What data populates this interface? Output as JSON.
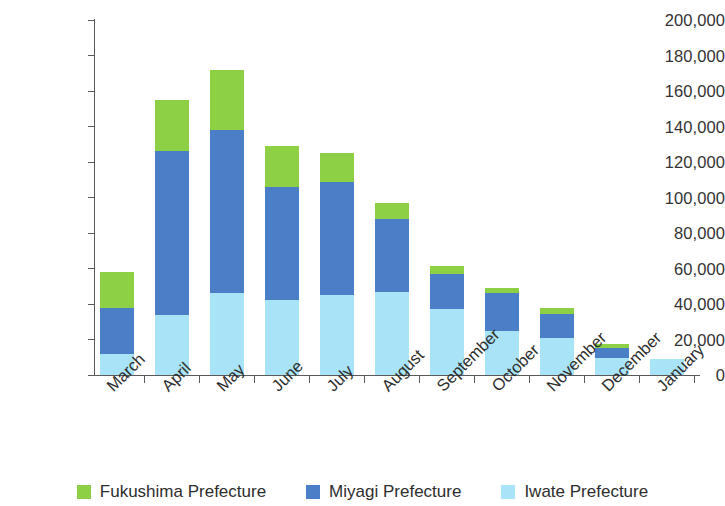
{
  "chart_data": {
    "type": "bar",
    "stacked": true,
    "title": "",
    "subtitle": "",
    "xlabel": "",
    "ylabel": "",
    "ylim": [
      0,
      200000
    ],
    "ytick_step": 20000,
    "ytick_labels": [
      "0",
      "20,000",
      "40,000",
      "60,000",
      "80,000",
      "100,000",
      "120,000",
      "140,000",
      "160,000",
      "180,000",
      "200,000"
    ],
    "ytick_values": [
      0,
      20000,
      40000,
      60000,
      80000,
      100000,
      120000,
      140000,
      160000,
      180000,
      200000
    ],
    "grid": false,
    "legend_position": "bottom",
    "categories": [
      "March",
      "April",
      "May",
      "June",
      "July",
      "August",
      "September",
      "October",
      "November",
      "December",
      "January"
    ],
    "series": [
      {
        "name": "Iwate Prefecture",
        "color": "#A8E3F7",
        "values": [
          12000,
          34000,
          46000,
          42000,
          45000,
          47000,
          37000,
          25000,
          21000,
          9500,
          9000
        ]
      },
      {
        "name": "Miyagi Prefecture",
        "color": "#4A7FC8",
        "values": [
          26000,
          92000,
          92000,
          64000,
          64000,
          41000,
          20000,
          21000,
          13500,
          5500,
          0
        ]
      },
      {
        "name": "Fukushima Prefecture",
        "color": "#8DCF45",
        "values": [
          20000,
          29000,
          34000,
          23000,
          16000,
          9000,
          4500,
          3000,
          3500,
          2500,
          0
        ]
      }
    ],
    "totals": [
      58000,
      155000,
      172000,
      129000,
      125000,
      97000,
      61500,
      49000,
      38000,
      17500,
      9000
    ],
    "legend_order": [
      "Fukushima Prefecture",
      "Miyagi Prefecture",
      "Iwate Prefecture"
    ]
  },
  "colors": {
    "fukushima": "#8DCF45",
    "miyagi": "#4A7FC8",
    "iwate": "#A8E3F7",
    "axis": "#5A5A5A",
    "text": "#2E2E2E",
    "background": "#FFFFFF"
  }
}
